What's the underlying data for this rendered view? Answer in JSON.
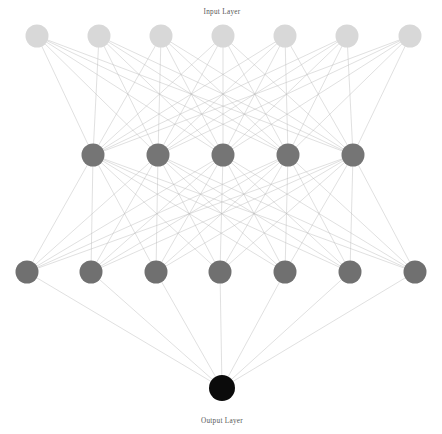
{
  "figure": {
    "title_top": "Input Layer",
    "title_bottom": "Output Layer",
    "background_color": "#ffffff",
    "edge_color": "#b9b9b9",
    "edge_width": 0.45
  },
  "chart_data": {
    "type": "diagram",
    "subtype": "neural-network-architecture",
    "title": "Input Layer",
    "xlabel": "",
    "ylabel": "",
    "grid": false,
    "legend": false,
    "annotations": [
      "Input Layer",
      "Output Layer"
    ],
    "layers": [
      {
        "name": "Input Layer",
        "index": 0,
        "node_count": 7,
        "color": "#d8d8d8",
        "radius": 11.5,
        "y": 36,
        "x_positions": [
          37,
          99,
          161,
          223,
          285,
          347,
          410
        ]
      },
      {
        "name": "Hidden Layer 1",
        "index": 1,
        "node_count": 5,
        "color": "#757575",
        "radius": 11.5,
        "y": 155,
        "x_positions": [
          93,
          158,
          223,
          288,
          353
        ]
      },
      {
        "name": "Hidden Layer 2",
        "index": 2,
        "node_count": 7,
        "color": "#707070",
        "radius": 11.5,
        "y": 272,
        "x_positions": [
          27,
          91,
          156,
          220,
          285,
          350,
          415
        ]
      },
      {
        "name": "Output Layer",
        "index": 3,
        "node_count": 1,
        "color": "#0b0b0b",
        "radius": 13,
        "y": 388,
        "x_positions": [
          222
        ]
      }
    ],
    "connections": [
      {
        "from_layer": 0,
        "to_layer": 1,
        "type": "fully-connected",
        "edge_count": 35
      },
      {
        "from_layer": 1,
        "to_layer": 2,
        "type": "fully-connected",
        "edge_count": 35
      },
      {
        "from_layer": 2,
        "to_layer": 3,
        "type": "fully-connected",
        "edge_count": 7
      }
    ],
    "total_nodes": 20,
    "total_edges": 77
  },
  "labels": {
    "top": {
      "text": "Input Layer",
      "x": 222,
      "y": 14
    },
    "bottom": {
      "text": "Output Layer",
      "x": 222,
      "y": 423
    }
  }
}
